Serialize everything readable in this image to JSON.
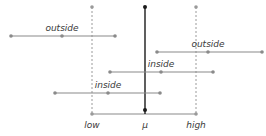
{
  "diagram": {
    "colors": {
      "interval": "#8a8a8a",
      "mean_line": "#1a1a1a",
      "guide": "#9a9a9a",
      "text": "#3a3a3a"
    },
    "axis": {
      "y": 114,
      "labels_y": 128,
      "markers": [
        {
          "id": "low",
          "label": "low",
          "x": 92,
          "style": "dashed"
        },
        {
          "id": "mu",
          "label": "μ",
          "x": 145,
          "style": "solid"
        },
        {
          "id": "high",
          "label": "high",
          "x": 196,
          "style": "dashed"
        }
      ]
    },
    "intervals": [
      {
        "label": "outside",
        "y": 36,
        "x1": 11,
        "xm": 62,
        "x2": 115
      },
      {
        "label": "outside",
        "y": 52,
        "x1": 157,
        "xm": 208,
        "x2": 262
      },
      {
        "label": "inside",
        "y": 72,
        "x1": 110,
        "xm": 161,
        "x2": 213
      },
      {
        "label": "inside",
        "y": 93,
        "x1": 55,
        "xm": 108,
        "x2": 160
      }
    ]
  }
}
